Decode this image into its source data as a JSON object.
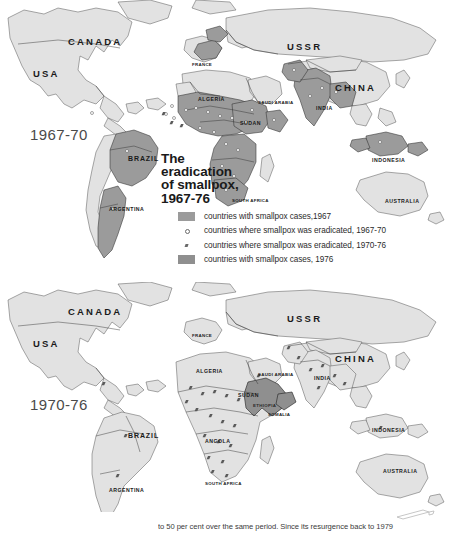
{
  "figure": {
    "title_lines": [
      "The",
      "eradication",
      "of smallpox,",
      "1967-76"
    ],
    "caption": "to 50 per cent over the same period. Since its resurgence back to 1979"
  },
  "legend": {
    "items": [
      {
        "swatch": "solid-mid-gray",
        "label": "countries with smallpox cases,1967"
      },
      {
        "swatch": "open-circle-mark",
        "label": "countries where smallpox was eradicated, 1967-70"
      },
      {
        "swatch": "filled-slash-mark",
        "label": "countries where smallpox was eradicated, 1970-76"
      },
      {
        "swatch": "solid-dark-gray",
        "label": "countries with smallpox cases, 1976"
      }
    ]
  },
  "colors": {
    "background": "#ffffff",
    "land_light": "#e2e2e2",
    "land_shaded": "#9b9b9b",
    "land_dark": "#8f8f8f",
    "border": "#2f2f2f",
    "coastline": "#555555",
    "label_text": "#1a1a1a",
    "era_text": "#4a4a4a"
  },
  "maps": [
    {
      "id": "map-top",
      "era_label": "1967-70",
      "labels": [
        {
          "name": "CANADA",
          "size": "big",
          "x": 68,
          "y": 36
        },
        {
          "name": "USA",
          "size": "big",
          "x": 33,
          "y": 68
        },
        {
          "name": "BRAZIL",
          "size": "mid",
          "x": 128,
          "y": 155
        },
        {
          "name": "ARGENTINA",
          "size": "sm",
          "x": 109,
          "y": 206
        },
        {
          "name": "USSR",
          "size": "big",
          "x": 287,
          "y": 41
        },
        {
          "name": "CHINA",
          "size": "big",
          "x": 335,
          "y": 82
        },
        {
          "name": "FRANCE",
          "size": "xs",
          "x": 192,
          "y": 62
        },
        {
          "name": "ALGERIA",
          "size": "sm",
          "x": 198,
          "y": 96
        },
        {
          "name": "SAUDI ARABIA",
          "size": "xs",
          "x": 258,
          "y": 100
        },
        {
          "name": "SUDAN",
          "size": "sm",
          "x": 240,
          "y": 120
        },
        {
          "name": "INDIA",
          "size": "sm",
          "x": 316,
          "y": 105
        },
        {
          "name": "INDONESIA",
          "size": "sm",
          "x": 372,
          "y": 157
        },
        {
          "name": "AUSTRALIA",
          "size": "sm",
          "x": 385,
          "y": 198
        },
        {
          "name": "SOUTH AFRICA",
          "size": "xs",
          "x": 232,
          "y": 198
        }
      ]
    },
    {
      "id": "map-bottom",
      "era_label": "1970-76",
      "labels": [
        {
          "name": "CANADA",
          "size": "big",
          "x": 68,
          "y": 306
        },
        {
          "name": "USA",
          "size": "big",
          "x": 33,
          "y": 338
        },
        {
          "name": "BRAZIL",
          "size": "mid",
          "x": 128,
          "y": 432
        },
        {
          "name": "ARGENTINA",
          "size": "sm",
          "x": 109,
          "y": 487
        },
        {
          "name": "USSR",
          "size": "big",
          "x": 287,
          "y": 313
        },
        {
          "name": "CHINA",
          "size": "big",
          "x": 335,
          "y": 353
        },
        {
          "name": "FRANCE",
          "size": "xs",
          "x": 192,
          "y": 333
        },
        {
          "name": "ALGERIA",
          "size": "sm",
          "x": 196,
          "y": 368
        },
        {
          "name": "SAUDI ARABIA",
          "size": "xs",
          "x": 258,
          "y": 372
        },
        {
          "name": "SUDAN",
          "size": "sm",
          "x": 238,
          "y": 392
        },
        {
          "name": "ETHIOPIA",
          "size": "xs",
          "x": 255,
          "y": 403
        },
        {
          "name": "SOMALIA",
          "size": "xs",
          "x": 268,
          "y": 412
        },
        {
          "name": "INDIA",
          "size": "sm",
          "x": 314,
          "y": 375
        },
        {
          "name": "ANGOLA",
          "size": "sm",
          "x": 213,
          "y": 438
        },
        {
          "name": "INDONESIA",
          "size": "sm",
          "x": 372,
          "y": 427
        },
        {
          "name": "AUSTRALIA",
          "size": "sm",
          "x": 383,
          "y": 468
        },
        {
          "name": "SOUTH AFRICA",
          "size": "xs",
          "x": 210,
          "y": 481
        }
      ]
    }
  ]
}
